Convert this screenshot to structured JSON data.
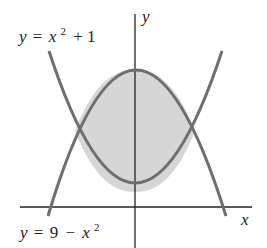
{
  "diagram": {
    "type": "region-between-curves",
    "axes": {
      "x_label": "x",
      "y_label": "y"
    },
    "curves": [
      {
        "id": "upper-opening",
        "equation": "y = x^2 + 1",
        "label_y": "y",
        "label_eq": "=",
        "label_x": "x",
        "label_exp": "2",
        "label_rest": "+ 1"
      },
      {
        "id": "lower-opening",
        "equation": "y = 9 - x^2",
        "label_y": "y",
        "label_eq": "=",
        "label_const": "9",
        "label_minus": "−",
        "label_x": "x",
        "label_exp": "2"
      }
    ],
    "shaded_region": {
      "description": "region between y = 9 - x^2 (top) and y = x^2 + 1 (bottom)",
      "x_range": [
        -2,
        2
      ],
      "fill": "#d6d6d6"
    },
    "intersections": [
      [
        -2,
        5
      ],
      [
        2,
        5
      ]
    ],
    "colors": {
      "curve": "#6e6e6e",
      "axis": "#222222",
      "shade": "#d6d6d6"
    }
  }
}
